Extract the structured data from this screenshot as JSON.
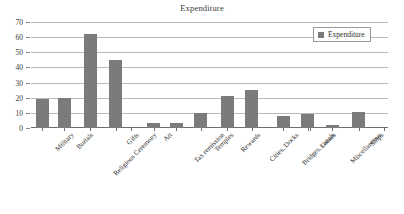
{
  "chart_data": {
    "type": "bar",
    "title": "Expenditure",
    "xlabel": "",
    "ylabel": "",
    "ylim": [
      0,
      70
    ],
    "ytick_step": 10,
    "yticks": [
      0,
      10,
      20,
      30,
      40,
      50,
      60,
      70
    ],
    "grid": true,
    "legend_position": "top-right",
    "legend": [
      "Expenditure"
    ],
    "series_name": "Expenditure",
    "bar_color": "#7b7b7b",
    "categories": [
      "Military",
      "Burials",
      "Religious Ceremony",
      "Gifts",
      "Art",
      "Tax remission",
      "Temples",
      "Rewards",
      "Cities, Docks",
      "Bridges, canals",
      "Losses",
      "Miscellaneous",
      "Ships"
    ],
    "values": [
      19,
      19.5,
      62,
      45,
      3,
      3,
      10,
      21,
      25,
      8,
      9,
      2,
      10.5
    ],
    "series": [
      {
        "name": "Expenditure",
        "values": [
          19,
          19.5,
          62,
          45,
          3,
          3,
          10,
          21,
          25,
          8,
          9,
          2,
          10.5
        ]
      }
    ]
  },
  "legend": {
    "label": "Expenditure",
    "marker": "square-marker"
  }
}
